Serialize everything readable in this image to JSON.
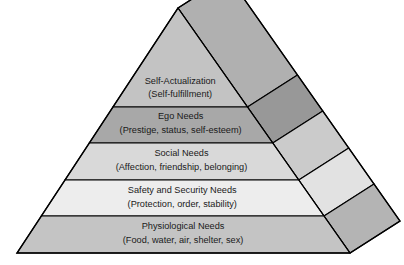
{
  "figure": {
    "name": "hierarchy-of-needs-pyramid",
    "type": "pyramid-diagram",
    "background_color": "#ffffff",
    "outline_color": "#000000",
    "text_color": "#1a1a1a"
  },
  "geometry": {
    "apex": [
      178,
      8
    ],
    "front_base_left": [
      17,
      253
    ],
    "front_base_right": [
      350,
      253
    ],
    "far_right_point": [
      400,
      221
    ],
    "depth_offset": [
      50,
      -32
    ],
    "tier_boundaries_y": [
      8,
      107,
      143,
      180,
      216,
      253
    ]
  },
  "tiers": [
    {
      "index": 1,
      "title": "Self-Actualization",
      "subtitle": "(Self-fulfillment)",
      "front_color": "#c3c3c3",
      "side_color": "#b0b0b0",
      "title_y": 82,
      "subtitle_y": 95
    },
    {
      "index": 2,
      "title": "Ego Needs",
      "subtitle": "(Prestige, status, self-esteem)",
      "front_color": "#a8a8a8",
      "side_color": "#989898",
      "title_y": 117,
      "subtitle_y": 131
    },
    {
      "index": 3,
      "title": "Social Needs",
      "subtitle": "(Affection, friendship, belonging)",
      "front_color": "#d9d9d9",
      "side_color": "#cbcbcb",
      "title_y": 154,
      "subtitle_y": 168
    },
    {
      "index": 4,
      "title": "Safety and Security Needs",
      "subtitle": "(Protection, order, stability)",
      "front_color": "#ededed",
      "side_color": "#e2e2e2",
      "title_y": 191,
      "subtitle_y": 205
    },
    {
      "index": 5,
      "title": "Physiological Needs",
      "subtitle": "(Food, water, air, shelter, sex)",
      "front_color": "#c4c4c4",
      "side_color": "#b4b4b4",
      "title_y": 227,
      "subtitle_y": 241
    }
  ]
}
